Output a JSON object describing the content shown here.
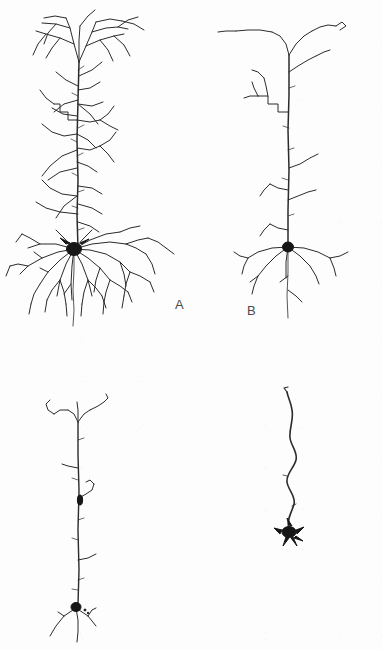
{
  "figure": {
    "type": "scientific-figure",
    "background_color": "#fdfdfd",
    "ink_color": "#2b2b2b",
    "soma_color": "#161616",
    "label_color": "#4a4a4a"
  },
  "panels": [
    {
      "label": "A",
      "label_x": 175,
      "label_y": 305,
      "name": "panel-a",
      "stage": "intact pyramidal neuron",
      "apical_tuft": "extensive, widely branched",
      "oblique_branches": 14,
      "basal_dendrites": 11,
      "soma_size": "large",
      "soma_x": 74,
      "soma_y": 249
    },
    {
      "label": "B",
      "label_x": 247,
      "label_y": 311,
      "name": "panel-b",
      "stage": "moderate dendritic loss",
      "apical_tuft": "simple Y-shaped fork",
      "oblique_branches": 8,
      "basal_dendrites": 6,
      "soma_size": "medium",
      "soma_x": 288,
      "soma_y": 247
    },
    {
      "label": "C",
      "label_x": 125,
      "label_y": 593,
      "name": "panel-c",
      "stage": "advanced dendritic loss",
      "apical_tuft": "small sparse fork",
      "oblique_branches": 4,
      "basal_dendrites": 3,
      "soma_size": "small",
      "soma_x": 76,
      "soma_y": 607
    },
    {
      "label": "D",
      "label_x": 285,
      "label_y": 598,
      "name": "panel-d",
      "stage": "terminal regression, bare apical shaft",
      "apical_tuft": "absent",
      "oblique_branches": 0,
      "basal_dendrites": 0,
      "soma_size": "shrunken",
      "soma_x": 289,
      "soma_y": 532
    }
  ]
}
